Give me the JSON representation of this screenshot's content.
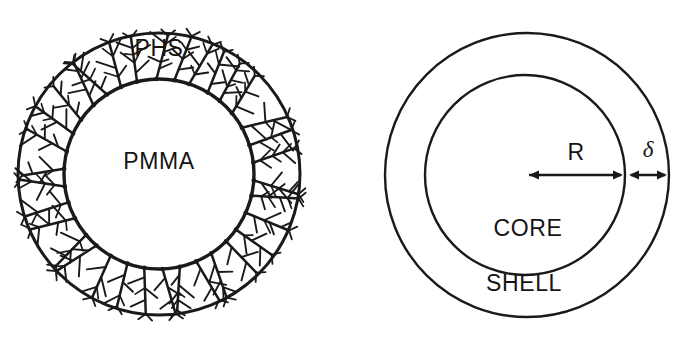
{
  "figure": {
    "background_color": "#ffffff",
    "line_color": "#1a1a1a",
    "text_color": "#141414",
    "width": 682,
    "height": 340
  },
  "left_diagram": {
    "name": "hairy-particle-schematic",
    "labels": {
      "outer_shell": "PHS",
      "core": "PMMA"
    },
    "geometry": {
      "center_x": 159,
      "center_y": 174,
      "outer_radius": 141,
      "inner_radius": 95,
      "hair_count": 34
    }
  },
  "right_diagram": {
    "name": "core-shell-schematic",
    "labels": {
      "core": "CORE",
      "shell": "SHELL",
      "radius": "R",
      "thickness": "δ"
    },
    "geometry": {
      "outer_center_x": 527,
      "outer_center_y": 175,
      "outer_radius": 142,
      "inner_center_x": 525,
      "inner_center_y": 175,
      "inner_radius": 100,
      "arrow_y": 175
    }
  }
}
